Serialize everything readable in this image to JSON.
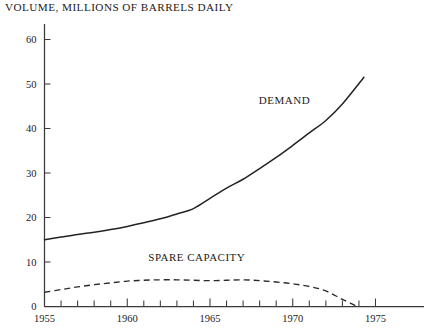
{
  "chart_data": {
    "type": "line",
    "title": "VOLUME, MILLIONS OF BARRELS DAILY",
    "xlabel": "",
    "ylabel": "",
    "xlim": [
      1955,
      1975
    ],
    "ylim": [
      0,
      60
    ],
    "grid": false,
    "legend_position": "inline-annotation",
    "x_ticks_major": [
      1955,
      1960,
      1965,
      1970,
      1975
    ],
    "x_tick_labels": [
      "1955",
      "1960",
      "1965",
      "1970",
      "1975"
    ],
    "x_ticks_minor_step": 1,
    "y_ticks": [
      0,
      10,
      20,
      30,
      40,
      50,
      60
    ],
    "y_tick_labels": [
      "0",
      "10",
      "20",
      "30",
      "40",
      "50",
      "60"
    ],
    "series": [
      {
        "name": "DEMAND",
        "style": "solid",
        "label_x": 1969.5,
        "label_y": 45.5,
        "x": [
          1955,
          1956,
          1957,
          1958,
          1959,
          1960,
          1961,
          1962,
          1963,
          1964,
          1965,
          1966,
          1967,
          1968,
          1969,
          1970,
          1971,
          1972,
          1973,
          1974.3
        ],
        "values": [
          15.0,
          15.6,
          16.2,
          16.7,
          17.3,
          18.0,
          18.8,
          19.7,
          20.8,
          22.0,
          24.3,
          26.6,
          28.6,
          31.0,
          33.5,
          36.2,
          39.0,
          41.8,
          45.5,
          51.5
        ]
      },
      {
        "name": "SPARE CAPACITY",
        "style": "dashed",
        "label_x": 1964.2,
        "label_y": 10.3,
        "x": [
          1955,
          1956,
          1957,
          1958,
          1959,
          1960,
          1961,
          1962,
          1963,
          1964,
          1965,
          1966,
          1967,
          1968,
          1969,
          1970,
          1971,
          1972,
          1973,
          1973.9
        ],
        "values": [
          3.2,
          3.8,
          4.4,
          4.9,
          5.3,
          5.7,
          5.9,
          6.0,
          6.0,
          5.9,
          5.8,
          5.9,
          6.0,
          5.8,
          5.5,
          5.1,
          4.5,
          3.5,
          1.6,
          0.0
        ]
      }
    ]
  }
}
